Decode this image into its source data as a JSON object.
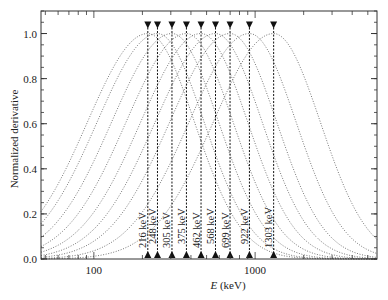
{
  "chart_data": {
    "type": "line",
    "title": "",
    "xlabel_italic": "E",
    "xlabel_rest": " (keV)",
    "xlabel": "E (keV)",
    "ylabel": "Normalized derivative",
    "xscale": "log",
    "xlim": [
      47,
      5700
    ],
    "ylim": [
      0.0,
      1.1
    ],
    "x_ticks": [
      {
        "value": 100,
        "label": "100"
      },
      {
        "value": 1000,
        "label": "1000"
      }
    ],
    "y_ticks": [
      {
        "value": 0.0,
        "label": "0.0"
      },
      {
        "value": 0.2,
        "label": "0.2"
      },
      {
        "value": 0.4,
        "label": "0.4"
      },
      {
        "value": 0.6,
        "label": "0.6"
      },
      {
        "value": 0.8,
        "label": "0.8"
      },
      {
        "value": 1.0,
        "label": "1.0"
      }
    ],
    "grid": false,
    "legend": "none",
    "curve_shape": "gaussian in log10(E), peak value 1.0",
    "sigma_log10_left": 0.375,
    "sigma_log10_right": 0.29,
    "series": [
      {
        "name": "216 keV",
        "peak_keV": 216,
        "label": "216 keV"
      },
      {
        "name": "248 keV",
        "peak_keV": 248,
        "label": "248 keV"
      },
      {
        "name": "305 keV",
        "peak_keV": 305,
        "label": "305 keV"
      },
      {
        "name": "375 keV",
        "peak_keV": 375,
        "label": "375 keV"
      },
      {
        "name": "462 keV",
        "peak_keV": 462,
        "label": "462 keV"
      },
      {
        "name": "568 keV",
        "peak_keV": 568,
        "label": "568 keV"
      },
      {
        "name": "699 keV",
        "peak_keV": 699,
        "label": "699 keV"
      },
      {
        "name": "922 keV",
        "peak_keV": 922,
        "label": "922 keV"
      },
      {
        "name": "1303 keV",
        "peak_keV": 1303,
        "label": "1303 keV"
      }
    ],
    "annotations": "Vertical dashed lines at each peak energy with downward triangle markers at y=1.0 (above top) and upward triangle markers at y=0.0; rotated energy labels near the bottom of each line"
  }
}
